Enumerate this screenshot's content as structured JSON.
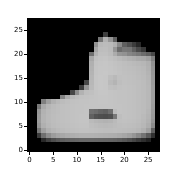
{
  "figure": {
    "background_color": "#ffffff",
    "width_px": 173,
    "height_px": 178
  },
  "axes": {
    "background_color": "#000000",
    "frame_on": false,
    "grid": false,
    "title": "",
    "xlabel": "",
    "ylabel": "",
    "x_ticks": [
      0,
      5,
      10,
      15,
      20,
      25
    ],
    "y_ticks": [
      0,
      5,
      10,
      15,
      20,
      25
    ],
    "x_tick_labels": [
      "0",
      "5",
      "10",
      "15",
      "20",
      "25"
    ],
    "y_tick_labels": [
      "0",
      "5",
      "10",
      "15",
      "20",
      "25"
    ],
    "xlim": [
      -0.5,
      27.5
    ],
    "ylim": [
      27.5,
      -0.5
    ],
    "tick_color": "#000000",
    "tick_label_color": "#000000"
  },
  "chart_data": {
    "type": "heatmap",
    "title": "",
    "xlabel": "",
    "ylabel": "",
    "subtitle": "",
    "colormap": "gray",
    "vmin": 0,
    "vmax": 255,
    "rows": 28,
    "cols": 28,
    "xlim": [
      -0.5,
      27.5
    ],
    "ylim": [
      27.5,
      -0.5
    ],
    "grid": false,
    "legend": "none",
    "annotations": [],
    "values": [
      [
        0,
        0,
        0,
        0,
        0,
        0,
        0,
        0,
        0,
        0,
        0,
        0,
        0,
        0,
        0,
        0,
        0,
        0,
        0,
        0,
        0,
        0,
        0,
        0,
        0,
        0,
        0,
        0
      ],
      [
        0,
        0,
        0,
        0,
        0,
        0,
        0,
        0,
        0,
        0,
        0,
        0,
        0,
        0,
        0,
        0,
        0,
        0,
        0,
        0,
        0,
        0,
        0,
        0,
        0,
        0,
        0,
        0
      ],
      [
        0,
        0,
        0,
        0,
        0,
        0,
        0,
        0,
        0,
        0,
        0,
        0,
        0,
        0,
        0,
        0,
        0,
        0,
        0,
        0,
        0,
        0,
        0,
        0,
        0,
        0,
        0,
        0
      ],
      [
        0,
        0,
        0,
        0,
        0,
        0,
        0,
        0,
        0,
        0,
        0,
        0,
        0,
        0,
        0,
        0,
        62,
        0,
        0,
        0,
        0,
        0,
        0,
        0,
        0,
        0,
        0,
        0
      ],
      [
        0,
        0,
        0,
        0,
        0,
        0,
        0,
        0,
        0,
        0,
        0,
        0,
        0,
        0,
        0,
        118,
        178,
        150,
        96,
        0,
        0,
        0,
        0,
        0,
        0,
        0,
        0,
        0
      ],
      [
        0,
        0,
        0,
        0,
        0,
        0,
        0,
        0,
        0,
        0,
        0,
        0,
        0,
        0,
        146,
        185,
        188,
        186,
        176,
        138,
        96,
        80,
        60,
        40,
        0,
        0,
        0,
        0
      ],
      [
        0,
        0,
        0,
        0,
        0,
        0,
        0,
        0,
        0,
        0,
        0,
        0,
        0,
        0,
        166,
        189,
        190,
        186,
        150,
        108,
        120,
        118,
        96,
        74,
        56,
        0,
        0,
        0
      ],
      [
        0,
        0,
        0,
        0,
        0,
        0,
        0,
        0,
        0,
        0,
        0,
        0,
        0,
        112,
        178,
        192,
        192,
        188,
        172,
        150,
        146,
        134,
        128,
        120,
        108,
        96,
        72,
        0
      ],
      [
        0,
        0,
        0,
        0,
        0,
        0,
        0,
        0,
        0,
        0,
        0,
        0,
        0,
        168,
        192,
        195,
        196,
        193,
        190,
        186,
        182,
        178,
        175,
        170,
        168,
        160,
        130,
        0
      ],
      [
        0,
        0,
        0,
        0,
        0,
        0,
        0,
        0,
        0,
        0,
        0,
        0,
        0,
        176,
        195,
        197,
        198,
        196,
        194,
        192,
        190,
        188,
        186,
        184,
        182,
        176,
        146,
        0
      ],
      [
        0,
        0,
        0,
        0,
        0,
        0,
        0,
        0,
        0,
        0,
        0,
        0,
        0,
        178,
        196,
        198,
        198,
        197,
        195,
        193,
        191,
        190,
        189,
        187,
        185,
        178,
        150,
        0
      ],
      [
        0,
        0,
        0,
        0,
        0,
        0,
        0,
        0,
        0,
        0,
        0,
        0,
        0,
        180,
        196,
        198,
        199,
        197,
        196,
        194,
        192,
        191,
        190,
        188,
        186,
        180,
        152,
        0
      ],
      [
        0,
        0,
        0,
        0,
        0,
        0,
        0,
        0,
        0,
        0,
        0,
        0,
        0,
        182,
        197,
        199,
        198,
        190,
        185,
        192,
        193,
        192,
        191,
        189,
        187,
        182,
        154,
        0
      ],
      [
        0,
        0,
        0,
        0,
        0,
        0,
        0,
        0,
        0,
        0,
        0,
        0,
        72,
        184,
        197,
        199,
        198,
        186,
        180,
        190,
        193,
        192,
        191,
        190,
        188,
        183,
        156,
        0
      ],
      [
        0,
        0,
        0,
        0,
        0,
        0,
        0,
        0,
        0,
        0,
        0,
        60,
        150,
        186,
        197,
        199,
        198,
        192,
        190,
        193,
        194,
        193,
        192,
        190,
        188,
        184,
        158,
        0
      ],
      [
        0,
        0,
        0,
        0,
        0,
        0,
        0,
        0,
        0,
        70,
        140,
        178,
        190,
        192,
        196,
        198,
        198,
        196,
        195,
        194,
        194,
        193,
        192,
        190,
        188,
        184,
        160,
        0
      ],
      [
        0,
        0,
        0,
        0,
        0,
        0,
        0,
        130,
        170,
        184,
        190,
        193,
        194,
        195,
        196,
        197,
        197,
        196,
        195,
        194,
        194,
        193,
        192,
        190,
        188,
        184,
        160,
        0
      ],
      [
        0,
        0,
        0,
        128,
        160,
        176,
        184,
        188,
        191,
        193,
        194,
        195,
        195,
        196,
        196,
        197,
        197,
        196,
        195,
        194,
        194,
        193,
        192,
        190,
        188,
        184,
        160,
        0
      ],
      [
        0,
        0,
        120,
        170,
        182,
        187,
        190,
        192,
        193,
        194,
        195,
        195,
        196,
        196,
        196,
        196,
        196,
        196,
        195,
        195,
        194,
        193,
        192,
        190,
        188,
        184,
        158,
        0
      ],
      [
        0,
        0,
        150,
        178,
        185,
        188,
        190,
        192,
        193,
        194,
        195,
        195,
        196,
        112,
        108,
        100,
        96,
        110,
        188,
        195,
        194,
        193,
        192,
        190,
        188,
        182,
        156,
        0
      ],
      [
        0,
        0,
        154,
        180,
        186,
        189,
        191,
        192,
        193,
        194,
        195,
        196,
        196,
        96,
        82,
        78,
        76,
        80,
        120,
        190,
        194,
        193,
        192,
        190,
        186,
        180,
        154,
        0
      ],
      [
        0,
        0,
        156,
        180,
        186,
        189,
        191,
        192,
        193,
        194,
        195,
        196,
        196,
        186,
        182,
        180,
        178,
        180,
        186,
        192,
        193,
        192,
        191,
        189,
        185,
        178,
        150,
        0
      ],
      [
        0,
        0,
        150,
        176,
        184,
        188,
        190,
        191,
        192,
        193,
        194,
        195,
        195,
        190,
        188,
        186,
        185,
        186,
        188,
        190,
        191,
        190,
        189,
        187,
        183,
        174,
        140,
        0
      ],
      [
        0,
        0,
        120,
        160,
        176,
        182,
        186,
        188,
        190,
        191,
        192,
        193,
        193,
        192,
        191,
        190,
        189,
        189,
        190,
        189,
        188,
        187,
        186,
        183,
        176,
        160,
        96,
        0
      ],
      [
        0,
        0,
        60,
        112,
        140,
        156,
        164,
        168,
        172,
        174,
        176,
        178,
        178,
        178,
        177,
        176,
        175,
        174,
        173,
        170,
        166,
        160,
        150,
        136,
        116,
        90,
        48,
        0
      ],
      [
        0,
        0,
        0,
        40,
        64,
        78,
        88,
        94,
        98,
        100,
        102,
        104,
        104,
        104,
        103,
        102,
        101,
        100,
        98,
        94,
        88,
        80,
        70,
        58,
        46,
        32,
        0,
        0
      ],
      [
        0,
        0,
        0,
        0,
        0,
        0,
        0,
        0,
        0,
        0,
        0,
        0,
        0,
        0,
        0,
        0,
        0,
        0,
        0,
        0,
        0,
        0,
        0,
        0,
        0,
        0,
        0,
        0
      ],
      [
        0,
        0,
        0,
        0,
        0,
        0,
        0,
        0,
        0,
        0,
        0,
        0,
        0,
        0,
        0,
        0,
        0,
        0,
        0,
        0,
        0,
        0,
        0,
        0,
        0,
        0,
        0,
        0
      ]
    ]
  }
}
